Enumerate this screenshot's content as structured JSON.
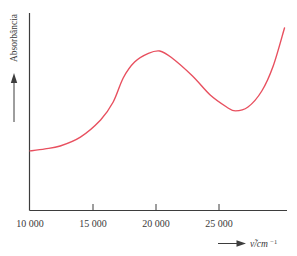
{
  "figure": {
    "background": "#ffffff",
    "axis_color": "#3d3d3d",
    "text_color": "#3a3a3a",
    "curve_color": "#e8505f"
  },
  "y_axis": {
    "label": "Absorbância",
    "arrow": "up-arrow"
  },
  "x_axis": {
    "label_prefix": "ν̃/cm",
    "label_exponent": "−1",
    "arrow": "right-arrow",
    "ticks": [
      "10 000",
      "15 000",
      "20 000",
      "25 000"
    ]
  },
  "chart_data": {
    "type": "line",
    "title": "",
    "xlabel": "ν̃/cm⁻¹",
    "ylabel": "Absorbância",
    "xlim": [
      10000,
      30400
    ],
    "ylim": [
      0,
      1
    ],
    "x_tick_values": [
      10000,
      15000,
      20000,
      25000
    ],
    "x_tick_labels": [
      "10 000",
      "15 000",
      "20 000",
      "25 000"
    ],
    "grid": false,
    "legend": false,
    "series": [
      {
        "name": "absorption-spectrum",
        "color": "#e8505f",
        "x": [
          10000,
          11200,
          12400,
          14000,
          15600,
          16600,
          17400,
          18300,
          19400,
          20300,
          21200,
          22900,
          24300,
          25600,
          26300,
          27300,
          28400,
          29300,
          30200
        ],
        "y": [
          0.3,
          0.31,
          0.325,
          0.37,
          0.457,
          0.548,
          0.67,
          0.751,
          0.795,
          0.807,
          0.775,
          0.68,
          0.584,
          0.523,
          0.503,
          0.523,
          0.604,
          0.731,
          0.924
        ]
      }
    ]
  }
}
